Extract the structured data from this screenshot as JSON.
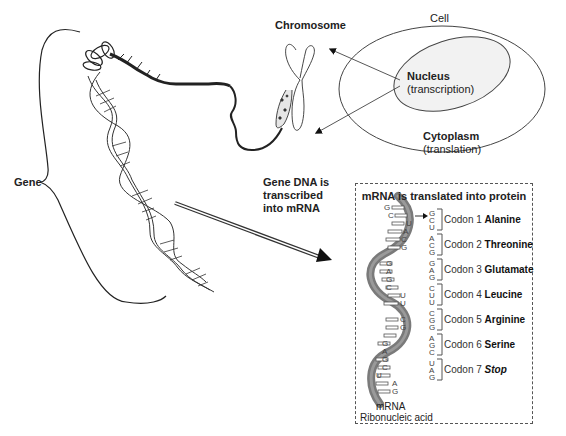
{
  "labels": {
    "gene": "Gene",
    "chromosome": "Chromosome",
    "cell": "Cell",
    "nucleus": "Nucleus",
    "nucleus_sub": "(transcription)",
    "cytoplasm": "Cytoplasm",
    "cytoplasm_sub": "(translation)",
    "transcription_line1": "Gene DNA is",
    "transcription_line2": "transcribed",
    "transcription_line3": "into mRNA"
  },
  "translation_box": {
    "title": "mRNA is translated into protein",
    "mrna_label": "mRNA",
    "caption": "Ribonucleic acid",
    "helix_bases": [
      "G",
      "C",
      "U",
      "A",
      "C",
      "G",
      "G",
      "A",
      "G",
      "C",
      "U",
      "U",
      "C",
      "G",
      "G",
      "A",
      "G",
      "C",
      "U",
      "A",
      "G"
    ],
    "codons": [
      {
        "label": "Codon 1",
        "amino_acid": "Alanine",
        "bases": [
          "G",
          "C",
          "U"
        ]
      },
      {
        "label": "Codon 2",
        "amino_acid": "Threonine",
        "bases": [
          "A",
          "C",
          "G"
        ]
      },
      {
        "label": "Codon 3",
        "amino_acid": "Glutamate",
        "bases": [
          "G",
          "A",
          "G"
        ]
      },
      {
        "label": "Codon 4",
        "amino_acid": "Leucine",
        "bases": [
          "C",
          "U",
          "U"
        ]
      },
      {
        "label": "Codon 5",
        "amino_acid": "Arginine",
        "bases": [
          "C",
          "G",
          "G"
        ]
      },
      {
        "label": "Codon 6",
        "amino_acid": "Serine",
        "bases": [
          "A",
          "G",
          "C"
        ]
      },
      {
        "label": "Codon 7",
        "amino_acid": "Stop",
        "bases": [
          "U",
          "A",
          "G"
        ]
      }
    ]
  },
  "colors": {
    "ink": "#222222",
    "rna_strand": "#7a7a7a",
    "nucleus_fill": "#f2f2f2",
    "dashed_border": "#555555"
  }
}
